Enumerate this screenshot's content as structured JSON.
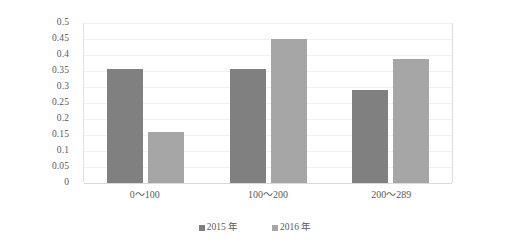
{
  "chart_data": {
    "type": "bar",
    "title": "",
    "subtitle": "",
    "xlabel": "",
    "ylabel": "",
    "categories": [
      "0～100",
      "100～200",
      "200～289"
    ],
    "series": [
      {
        "name": "2015 年",
        "values": [
          0.355,
          0.355,
          0.29
        ],
        "color": "#808080"
      },
      {
        "name": "2016 年",
        "values": [
          0.16,
          0.45,
          0.388
        ],
        "color": "#a6a6a6"
      }
    ],
    "ylim": [
      0,
      0.5
    ],
    "ytick_step": 0.05,
    "ytick_labels": [
      "0.5",
      "0.45",
      "0.4",
      "0.35",
      "0.3",
      "0.25",
      "0.2",
      "0.15",
      "0.1",
      "0.05",
      "0"
    ],
    "ytick_values": [
      0.5,
      0.45,
      0.4,
      0.35,
      0.3,
      0.25,
      0.2,
      0.15,
      0.1,
      0.05,
      0
    ],
    "grid": true,
    "grid_orientation": "horizontal",
    "grid_color": "#f0f0f0",
    "legend_position": "bottom",
    "plot_background": "#ffffff"
  },
  "legend": {
    "items": [
      {
        "label": "2015 年",
        "marker": "square-marker-icon",
        "color": "#808080"
      },
      {
        "label": "2016 年",
        "marker": "square-marker-icon",
        "color": "#a6a6a6"
      }
    ]
  }
}
